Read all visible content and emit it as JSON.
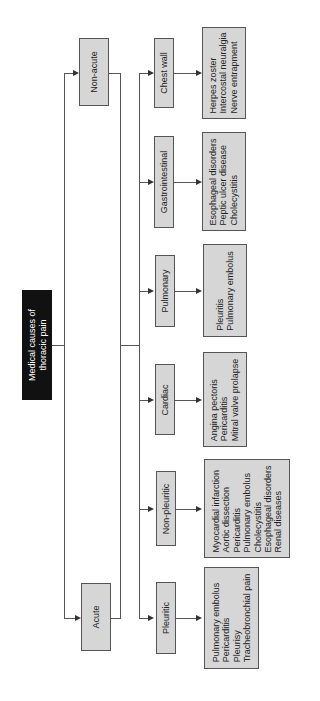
{
  "diagram": {
    "title": [
      "Medical causes of",
      "thoracic pain"
    ],
    "branches": [
      {
        "label": "Non-acute",
        "categories": [
          {
            "label": "Chest wall",
            "causes": [
              "Herpes zoster",
              "Intercostal neuralgia",
              "Nerve entrapment"
            ]
          },
          {
            "label": "Gastrointestinal",
            "causes": [
              "Esophageal disorders",
              "Peptic ulcer disease",
              "Cholecystitis"
            ]
          },
          {
            "label": "Pulmonary",
            "causes": [
              "Pleuritis",
              "Pulmonary embolus"
            ]
          },
          {
            "label": "Cardiac",
            "causes": [
              "Angina pectoris",
              "Pericarditis",
              "Mitral valve prolapse"
            ]
          }
        ]
      },
      {
        "label": "Acute",
        "categories": [
          {
            "label": "Non-pleuritic",
            "causes": [
              "Myocardial infarction",
              "Aortic dissection",
              "Pericarditis",
              "Pulmonary embolus",
              "Cholecystitis",
              "Esophageal disorders",
              "Renal diseases"
            ]
          },
          {
            "label": "Pleuritic",
            "causes": [
              "Pulmonary embolus",
              "Pericarditis",
              "Pleurisy",
              "Tracheobronchial pain"
            ]
          }
        ]
      }
    ],
    "colors": {
      "box_fill": "#d6d6d6",
      "title_fill": "#111111",
      "line": "#555555"
    }
  }
}
